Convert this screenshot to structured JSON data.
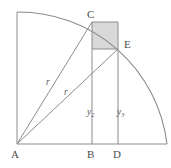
{
  "figure": {
    "colors": {
      "stroke": "#8c8c8c",
      "label": "#4d4d4d",
      "shade_fill": "#d9d9d9",
      "background": "#ffffff"
    },
    "points": [
      {
        "id": "A",
        "label": "A",
        "x": 17,
        "y": 144,
        "label_x": 11,
        "label_y": 158
      },
      {
        "id": "B",
        "label": "B",
        "x": 92,
        "y": 144,
        "label_x": 87,
        "label_y": 158
      },
      {
        "id": "C",
        "label": "C",
        "x": 92,
        "y": 22,
        "label_x": 87,
        "label_y": 18
      },
      {
        "id": "D",
        "label": "D",
        "x": 118,
        "y": 144,
        "label_x": 113,
        "label_y": 158
      },
      {
        "id": "E",
        "label": "E",
        "x": 118,
        "y": 49,
        "label_x": 124,
        "label_y": 48
      }
    ],
    "radius_labels": [
      {
        "id": "r-AC",
        "text": "r",
        "x": 46,
        "y": 85
      },
      {
        "id": "r-AE",
        "text": "r",
        "x": 64,
        "y": 95
      }
    ],
    "height_labels": [
      {
        "id": "y2",
        "base": "y",
        "subscript": "2",
        "x": 87,
        "y": 115
      },
      {
        "id": "y3",
        "base": "y",
        "subscript": "3",
        "x": 117,
        "y": 115
      }
    ],
    "arc": {
      "center_x": 17,
      "center_y": 144,
      "radius": 150,
      "start_x": 17,
      "start_y": 12,
      "end_x": 167,
      "end_y": 144
    },
    "shaded_rect": {
      "x": 92,
      "y": 22,
      "width": 26,
      "height": 27
    },
    "outer_rect": {
      "x": 92,
      "y": 22,
      "width": 26,
      "height": 122
    }
  }
}
